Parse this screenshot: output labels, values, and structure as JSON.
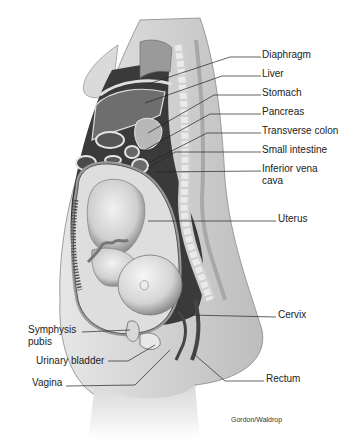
{
  "figure": {
    "type": "anatomical illustration",
    "credit": "Gordon/Waldrop"
  },
  "labels_right": [
    {
      "text": "Diaphragm",
      "x": 262,
      "y": 49,
      "target": [
        148,
        84
      ]
    },
    {
      "text": "Liver",
      "x": 262,
      "y": 68,
      "target": [
        145,
        103
      ]
    },
    {
      "text": "Stomach",
      "x": 262,
      "y": 87,
      "target": [
        148,
        133
      ]
    },
    {
      "text": "Pancreas",
      "x": 262,
      "y": 106,
      "target": [
        145,
        150
      ]
    },
    {
      "text": "Transverse colon",
      "x": 262,
      "y": 125,
      "target": [
        148,
        163
      ]
    },
    {
      "text": "Small intestine",
      "x": 262,
      "y": 144,
      "target": [
        148,
        168
      ]
    },
    {
      "text": "Inferior vena",
      "line2": "cava",
      "x": 262,
      "y": 163,
      "target": [
        155,
        172
      ]
    },
    {
      "text": "Uterus",
      "x": 278,
      "y": 213,
      "target": [
        148,
        221
      ]
    },
    {
      "text": "Cervix",
      "x": 278,
      "y": 309,
      "target": [
        190,
        315
      ]
    },
    {
      "text": "Rectum",
      "x": 266,
      "y": 373,
      "target": [
        195,
        355
      ]
    }
  ],
  "labels_left": [
    {
      "text": "Symphysis",
      "line2": "pubis",
      "x": 28,
      "y": 324,
      "target": [
        130,
        330
      ]
    },
    {
      "text": "Urinary bladder",
      "x": 36,
      "y": 355,
      "target": [
        155,
        345
      ]
    },
    {
      "text": "Vagina",
      "x": 32,
      "y": 377,
      "target": [
        170,
        350
      ]
    }
  ]
}
